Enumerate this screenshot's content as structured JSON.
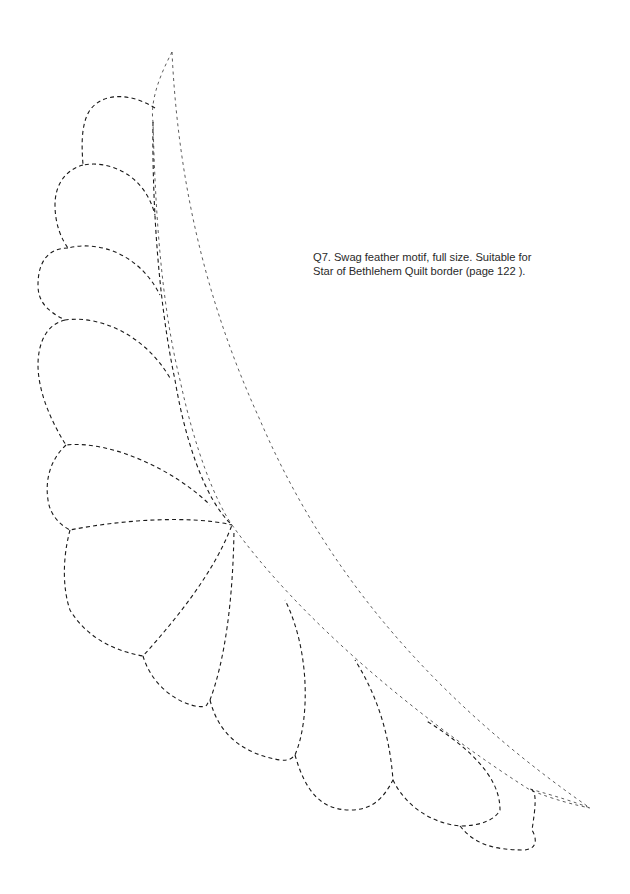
{
  "page": {
    "type": "quilting-pattern-page",
    "background_color": "#ffffff",
    "line_color": "#1a1a1a"
  },
  "caption": {
    "line1": "Q7. Swag feather motif, full size. Suitable for",
    "line2": "Star of Bethlehem Quilt border (page 122 )."
  },
  "motif": {
    "name": "swag-feather-motif",
    "line_style": "dashed",
    "feather_count": 10
  }
}
